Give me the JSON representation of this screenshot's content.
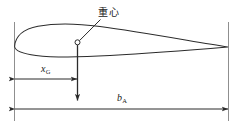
{
  "figure": {
    "type": "engineering-diagram",
    "background_color": "#ffffff",
    "line_color": "#2b2b2b",
    "guide_line_color": "#8a8a8a",
    "width_px": 244,
    "height_px": 131
  },
  "labels": {
    "center_of_gravity": "重心",
    "cg_distance_symbol": "x",
    "cg_distance_subscript": "G",
    "chord_symbol": "b",
    "chord_subscript": "A"
  },
  "annotations": {
    "cg_marker": "open-circle",
    "cg_leader": "leader-line-from-circle-to-label",
    "weight_vector": "downward-arrow-from-cg",
    "dimension_xg": "double-headed-arrow-leading-edge-to-cg",
    "dimension_ba": "double-headed-arrow-leading-edge-to-trailing-edge"
  },
  "geometry": {
    "leading_edge_x": 14,
    "trailing_edge_x": 228,
    "chord_line_y": 47,
    "cg_x": 77,
    "cg_y": 42,
    "xg_dim_y": 79,
    "ba_dim_y": 109,
    "weight_arrow_tip_y": 101
  }
}
